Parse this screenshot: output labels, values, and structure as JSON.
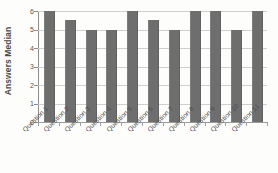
{
  "chart_data": {
    "type": "bar",
    "title": "",
    "subtitle": "",
    "xlabel": "",
    "ylabel": "Answers Median",
    "ylim": [
      0,
      6
    ],
    "y_ticks": [
      0,
      1,
      2,
      3,
      4,
      5,
      6
    ],
    "grid": true,
    "legend": false,
    "legend_position": "none",
    "orientation": "vertical",
    "categories": [
      "Question 1",
      "Question 2",
      "Question 3",
      "Question 4",
      "Question 5",
      "Question 6",
      "Question 7",
      "Question 8",
      "Question 9",
      "Question 10",
      "Question 11"
    ],
    "values": [
      6,
      5.5,
      5,
      5,
      6,
      5.5,
      5,
      6,
      6,
      5,
      6
    ],
    "series": [
      {
        "name": "Answers Median",
        "values": [
          6,
          5.5,
          5,
          5,
          6,
          5.5,
          5,
          6,
          6,
          5,
          6
        ]
      }
    ],
    "colors": {
      "bar": "#6e6e6e",
      "gridline": "#cfcfcf",
      "axis": "#8d8d8d",
      "background": "#fdfdfc",
      "tick_label": "#555555",
      "axis_title": "#4a4a4a"
    }
  }
}
